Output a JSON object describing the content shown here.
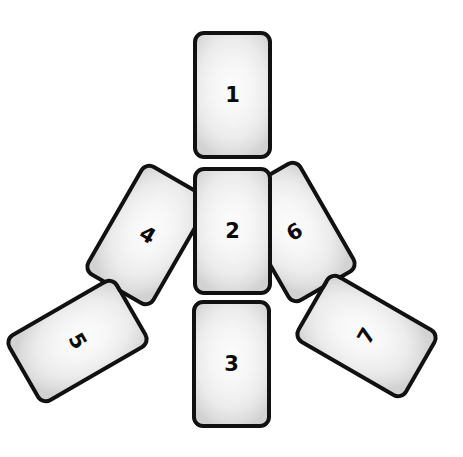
{
  "figure": {
    "background_color": "#ffffff",
    "card_border_color": "#111111",
    "card_fill_light": "#fcfcfc",
    "card_fill_dark": "#d2d2d2",
    "number_color": "#0a0a0a",
    "card_width": 79,
    "card_height": 128
  },
  "cards": [
    {
      "label": "1",
      "name": "card-1",
      "left": 193,
      "top": 31,
      "rotation": 0,
      "z": 7,
      "number_rotation": 0
    },
    {
      "label": "2",
      "name": "card-2",
      "left": 193,
      "top": 167,
      "rotation": 0,
      "z": 6,
      "number_rotation": 0
    },
    {
      "label": "3",
      "name": "card-3",
      "left": 192,
      "top": 300,
      "rotation": 0,
      "z": 5,
      "number_rotation": 0
    },
    {
      "label": "4",
      "name": "card-4",
      "left": 108,
      "top": 171,
      "rotation": 30,
      "z": 3,
      "number_rotation": 30
    },
    {
      "label": "5",
      "name": "card-5",
      "left": 38,
      "top": 277,
      "rotation": 60,
      "z": 4,
      "number_rotation": 60
    },
    {
      "label": "6",
      "name": "card-6",
      "left": 255,
      "top": 168,
      "rotation": -30,
      "z": 2,
      "number_rotation": -30
    },
    {
      "label": "7",
      "name": "card-7",
      "left": 327,
      "top": 272,
      "rotation": -60,
      "z": 3,
      "number_rotation": -60
    }
  ]
}
